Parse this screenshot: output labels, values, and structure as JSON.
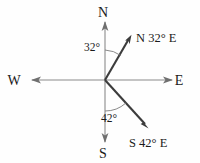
{
  "diagram": {
    "origin": {
      "x": 105,
      "y": 80
    },
    "background_color": "#fefefe",
    "axis_color": "#8a8a8a",
    "ray_color": "#3c3c3c",
    "text_color": "#1b1b1b",
    "cardinals": [
      {
        "key": "north",
        "label": "N",
        "x": 103,
        "y": 17,
        "tip_x": 105,
        "tip_y": 22
      },
      {
        "key": "south",
        "label": "S",
        "x": 103,
        "y": 158,
        "tip_x": 105,
        "tip_y": 142
      },
      {
        "key": "west",
        "label": "W",
        "x": 14,
        "y": 85,
        "tip_x": 32,
        "tip_y": 80
      },
      {
        "key": "east",
        "label": "E",
        "x": 179,
        "y": 85,
        "tip_x": 172,
        "tip_y": 80
      }
    ],
    "rays": [
      {
        "key": "ray-n32e",
        "label": "N 32° E",
        "angle_label": "32°",
        "angle_degrees": 32,
        "from_cardinal": "N",
        "toward_cardinal": "E",
        "tip_x": 131,
        "tip_y": 36,
        "label_x": 136,
        "label_y": 42,
        "angle_label_x": 84,
        "angle_label_y": 51,
        "arc_radius": 30
      },
      {
        "key": "ray-s42e",
        "label": "S 42° E",
        "angle_label": "42°",
        "angle_degrees": 42,
        "from_cardinal": "S",
        "toward_cardinal": "E",
        "tip_x": 148,
        "tip_y": 128,
        "label_x": 129,
        "label_y": 147,
        "angle_label_x": 101,
        "angle_label_y": 122,
        "arc_radius": 31
      }
    ]
  }
}
